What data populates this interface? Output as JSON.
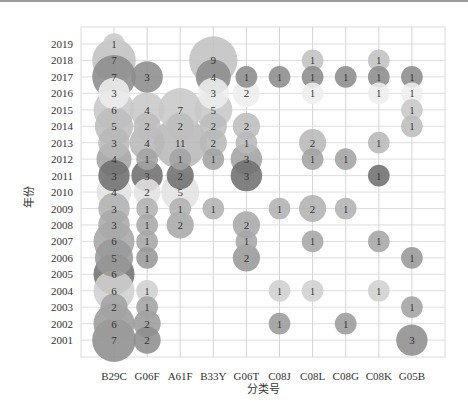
{
  "chart_data": {
    "type": "bubble",
    "title": "",
    "xlabel": "分类号",
    "ylabel": "年份",
    "grid": true,
    "legend": "none",
    "categories": [
      "B29C",
      "G06F",
      "A61F",
      "B33Y",
      "G06T",
      "C08J",
      "C08L",
      "C08G",
      "C08K",
      "G05B"
    ],
    "years": [
      2019,
      2018,
      2017,
      2016,
      2015,
      2014,
      2013,
      2012,
      2011,
      2010,
      2009,
      2008,
      2007,
      2006,
      2005,
      2004,
      2003,
      2002,
      2001
    ],
    "year_colors": {
      "2019": "#c9c9c9",
      "2018": "#c2c2c2",
      "2017": "#8c8c8c",
      "2016": "#eeeeee",
      "2015": "#c8c8c8",
      "2014": "#bdbdbd",
      "2013": "#b8b8b8",
      "2012": "#a3a3a3",
      "2011": "#6f6f6f",
      "2010": "#e2e2e2",
      "2009": "#b2b2b2",
      "2008": "#a9a9a9",
      "2007": "#a6a6a6",
      "2006": "#999999",
      "2005": "#727272",
      "2004": "#d0d0d0",
      "2003": "#a3a3a3",
      "2002": "#9b9b9b",
      "2001": "#8e8e8e"
    },
    "points": [
      {
        "category": "B29C",
        "year": 2019,
        "value": 1
      },
      {
        "category": "B29C",
        "year": 2018,
        "value": 7
      },
      {
        "category": "B29C",
        "year": 2017,
        "value": 7
      },
      {
        "category": "B29C",
        "year": 2016,
        "value": 3
      },
      {
        "category": "B29C",
        "year": 2015,
        "value": 6
      },
      {
        "category": "B29C",
        "year": 2014,
        "value": 5
      },
      {
        "category": "B29C",
        "year": 2013,
        "value": 3
      },
      {
        "category": "B29C",
        "year": 2012,
        "value": 4
      },
      {
        "category": "B29C",
        "year": 2011,
        "value": 3
      },
      {
        "category": "B29C",
        "year": 2010,
        "value": 4
      },
      {
        "category": "B29C",
        "year": 2009,
        "value": 3
      },
      {
        "category": "B29C",
        "year": 2008,
        "value": 3
      },
      {
        "category": "B29C",
        "year": 2007,
        "value": 6
      },
      {
        "category": "B29C",
        "year": 2006,
        "value": 5
      },
      {
        "category": "B29C",
        "year": 2005,
        "value": 6
      },
      {
        "category": "B29C",
        "year": 2004,
        "value": 6
      },
      {
        "category": "B29C",
        "year": 2003,
        "value": 2
      },
      {
        "category": "B29C",
        "year": 2002,
        "value": 6
      },
      {
        "category": "B29C",
        "year": 2001,
        "value": 7
      },
      {
        "category": "G06F",
        "year": 2017,
        "value": 3
      },
      {
        "category": "G06F",
        "year": 2015,
        "value": 4
      },
      {
        "category": "G06F",
        "year": 2014,
        "value": 2
      },
      {
        "category": "G06F",
        "year": 2013,
        "value": 4
      },
      {
        "category": "G06F",
        "year": 2012,
        "value": 1
      },
      {
        "category": "G06F",
        "year": 2011,
        "value": 3
      },
      {
        "category": "G06F",
        "year": 2010,
        "value": 2
      },
      {
        "category": "G06F",
        "year": 2009,
        "value": 1
      },
      {
        "category": "G06F",
        "year": 2008,
        "value": 1
      },
      {
        "category": "G06F",
        "year": 2007,
        "value": 1
      },
      {
        "category": "G06F",
        "year": 2006,
        "value": 1
      },
      {
        "category": "G06F",
        "year": 2004,
        "value": 1
      },
      {
        "category": "G06F",
        "year": 2003,
        "value": 1
      },
      {
        "category": "G06F",
        "year": 2002,
        "value": 2
      },
      {
        "category": "G06F",
        "year": 2001,
        "value": 2
      },
      {
        "category": "A61F",
        "year": 2015,
        "value": 7
      },
      {
        "category": "A61F",
        "year": 2014,
        "value": 2
      },
      {
        "category": "A61F",
        "year": 2013,
        "value": 11
      },
      {
        "category": "A61F",
        "year": 2012,
        "value": 1
      },
      {
        "category": "A61F",
        "year": 2011,
        "value": 2
      },
      {
        "category": "A61F",
        "year": 2010,
        "value": 5
      },
      {
        "category": "A61F",
        "year": 2009,
        "value": 1
      },
      {
        "category": "A61F",
        "year": 2008,
        "value": 2
      },
      {
        "category": "B33Y",
        "year": 2018,
        "value": 9
      },
      {
        "category": "B33Y",
        "year": 2017,
        "value": 4
      },
      {
        "category": "B33Y",
        "year": 2016,
        "value": 3
      },
      {
        "category": "B33Y",
        "year": 2015,
        "value": 5
      },
      {
        "category": "B33Y",
        "year": 2014,
        "value": 2
      },
      {
        "category": "B33Y",
        "year": 2013,
        "value": 2
      },
      {
        "category": "B33Y",
        "year": 2012,
        "value": 1
      },
      {
        "category": "B33Y",
        "year": 2009,
        "value": 1
      },
      {
        "category": "G06T",
        "year": 2017,
        "value": 1
      },
      {
        "category": "G06T",
        "year": 2016,
        "value": 2
      },
      {
        "category": "G06T",
        "year": 2014,
        "value": 2
      },
      {
        "category": "G06T",
        "year": 2013,
        "value": 1
      },
      {
        "category": "G06T",
        "year": 2012,
        "value": 3
      },
      {
        "category": "G06T",
        "year": 2011,
        "value": 3
      },
      {
        "category": "G06T",
        "year": 2008,
        "value": 2
      },
      {
        "category": "G06T",
        "year": 2007,
        "value": 1
      },
      {
        "category": "G06T",
        "year": 2006,
        "value": 2
      },
      {
        "category": "C08J",
        "year": 2017,
        "value": 1
      },
      {
        "category": "C08J",
        "year": 2009,
        "value": 1
      },
      {
        "category": "C08J",
        "year": 2004,
        "value": 1
      },
      {
        "category": "C08J",
        "year": 2002,
        "value": 1
      },
      {
        "category": "C08L",
        "year": 2018,
        "value": 1
      },
      {
        "category": "C08L",
        "year": 2017,
        "value": 1
      },
      {
        "category": "C08L",
        "year": 2016,
        "value": 1
      },
      {
        "category": "C08L",
        "year": 2013,
        "value": 2
      },
      {
        "category": "C08L",
        "year": 2012,
        "value": 1
      },
      {
        "category": "C08L",
        "year": 2009,
        "value": 2
      },
      {
        "category": "C08L",
        "year": 2007,
        "value": 1
      },
      {
        "category": "C08L",
        "year": 2004,
        "value": 1
      },
      {
        "category": "C08G",
        "year": 2017,
        "value": 1
      },
      {
        "category": "C08G",
        "year": 2012,
        "value": 1
      },
      {
        "category": "C08G",
        "year": 2009,
        "value": 1
      },
      {
        "category": "C08G",
        "year": 2002,
        "value": 1
      },
      {
        "category": "C08K",
        "year": 2018,
        "value": 1
      },
      {
        "category": "C08K",
        "year": 2017,
        "value": 1
      },
      {
        "category": "C08K",
        "year": 2016,
        "value": 1
      },
      {
        "category": "C08K",
        "year": 2013,
        "value": 1
      },
      {
        "category": "C08K",
        "year": 2011,
        "value": 1
      },
      {
        "category": "C08K",
        "year": 2007,
        "value": 1
      },
      {
        "category": "C08K",
        "year": 2004,
        "value": 1
      },
      {
        "category": "G05B",
        "year": 2017,
        "value": 1
      },
      {
        "category": "G05B",
        "year": 2016,
        "value": 1
      },
      {
        "category": "G05B",
        "year": 2015,
        "value": 1
      },
      {
        "category": "G05B",
        "year": 2014,
        "value": 1
      },
      {
        "category": "G05B",
        "year": 2006,
        "value": 1
      },
      {
        "category": "G05B",
        "year": 2003,
        "value": 1
      },
      {
        "category": "G05B",
        "year": 2001,
        "value": 3
      }
    ]
  },
  "layout": {
    "plot": {
      "left": 81,
      "top": 27,
      "right": 445,
      "bottom": 357
    },
    "first_col_x": 114,
    "col_step": 33.1,
    "first_row_y": 44,
    "row_step": 16.45
  }
}
